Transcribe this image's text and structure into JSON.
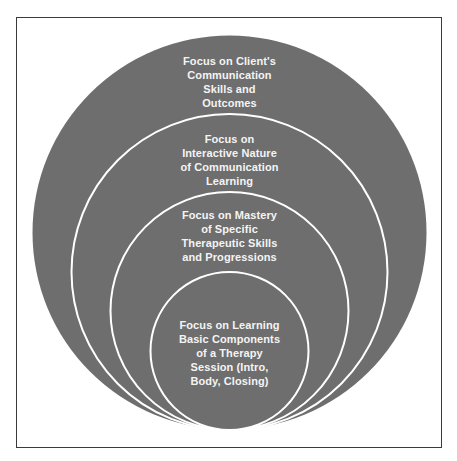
{
  "diagram": {
    "type": "nested-concentric-circles",
    "colors": {
      "fill": "#6e6e6e",
      "ring_stroke": "#ffffff",
      "text": "#f4f4f4",
      "frame": "#3a3a3a"
    },
    "levels": [
      {
        "lines": [
          "Focus on Client's",
          "Communication",
          "Skills and",
          "Outcomes"
        ]
      },
      {
        "lines": [
          "Focus on",
          "Interactive Nature",
          "of Communication",
          "Learning"
        ]
      },
      {
        "lines": [
          "Focus on Mastery",
          "of Specific",
          "Therapeutic Skills",
          "and Progressions"
        ]
      },
      {
        "lines": [
          "Focus on Learning",
          "Basic Components",
          "of a Therapy",
          "Session (Intro,",
          "Body, Closing)"
        ]
      }
    ]
  }
}
